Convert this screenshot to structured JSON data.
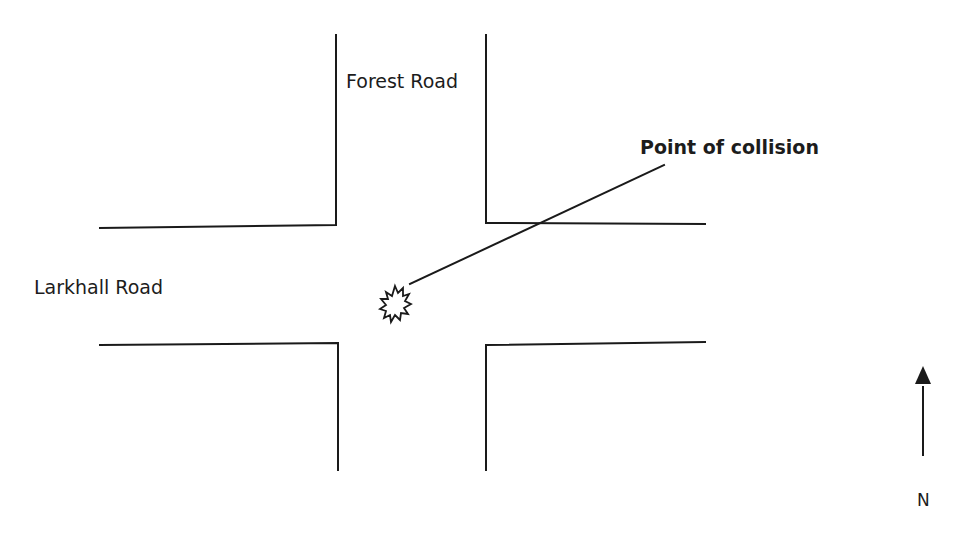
{
  "diagram": {
    "type": "road-junction-sketch",
    "roads": [
      {
        "name": "Forest Road",
        "orientation": "north-south"
      },
      {
        "name": "Larkhall Road",
        "orientation": "east-west"
      }
    ],
    "labels": {
      "forest_road": "Forest Road",
      "larkhall_road": "Larkhall Road",
      "collision": "Point of collision",
      "north": "N"
    },
    "markers": [
      {
        "name": "collision-point",
        "shape": "starburst",
        "position": "centre of junction"
      }
    ],
    "compass": {
      "direction": "north",
      "label": "N"
    },
    "colors": {
      "line": "#1a1a1a",
      "background": "#ffffff"
    }
  }
}
